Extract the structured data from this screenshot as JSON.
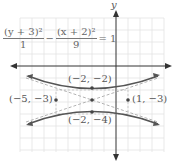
{
  "diagram": {
    "type": "hyperbola-graph",
    "equation": {
      "term1_numerator": "(y + 3)²",
      "term1_denominator": "1",
      "minus": "−",
      "term2_numerator": "(x + 2)²",
      "term2_denominator": "9",
      "equals": "= 1"
    },
    "axis_labels": {
      "y": "y"
    },
    "points": [
      {
        "label": "(−2, −2)",
        "x": -2,
        "y": -2,
        "role": "vertex"
      },
      {
        "label": "(−2, −4)",
        "x": -2,
        "y": -4,
        "role": "vertex"
      },
      {
        "label": "(−5, −3)",
        "x": -5,
        "y": -3,
        "role": "co-vertex"
      },
      {
        "label": "(1, −3)",
        "x": 1,
        "y": -3,
        "role": "co-vertex"
      },
      {
        "label": "",
        "x": -2,
        "y": -3,
        "role": "center"
      }
    ],
    "colors": {
      "curve": "#555555",
      "asymptote": "#999999",
      "grid": "#dddddd",
      "axis": "#333333"
    }
  }
}
